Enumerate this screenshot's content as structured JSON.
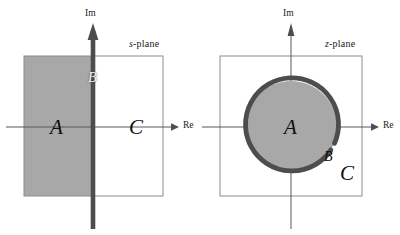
{
  "figure": {
    "width": 400,
    "height": 235,
    "background": "#ffffff"
  },
  "colors": {
    "region_fill": "#a8a8a8",
    "bold_contour": "#4d4d4d",
    "box_stroke": "#8c8c8c",
    "axis_stroke": "#595959",
    "text": "#1a1a1a"
  },
  "panels": [
    {
      "id": "s-plane",
      "plane_label": {
        "symbol": "s",
        "suffix": "-plane"
      },
      "axes": {
        "imaginary_label": "Im",
        "real_label": "Re"
      },
      "region_labels": [
        {
          "name": "A",
          "text": "A",
          "role": "region-interior"
        },
        {
          "name": "B",
          "text": "B",
          "role": "boundary-on-imaginary-axis"
        },
        {
          "name": "C",
          "text": "C",
          "role": "region-exterior"
        }
      ],
      "description_values": {
        "shaded_region": "left half plane",
        "bold_contour": "imaginary axis"
      }
    },
    {
      "id": "z-plane",
      "plane_label": {
        "symbol": "z",
        "suffix": "-plane"
      },
      "axes": {
        "imaginary_label": "Im",
        "real_label": "Re"
      },
      "region_labels": [
        {
          "name": "A",
          "text": "A",
          "role": "region-interior"
        },
        {
          "name": "B",
          "text": "B",
          "role": "boundary-on-unit-circle"
        },
        {
          "name": "C",
          "text": "C",
          "role": "region-exterior"
        }
      ],
      "description_values": {
        "shaded_region": "unit disk interior",
        "bold_contour": "unit circle"
      }
    }
  ]
}
